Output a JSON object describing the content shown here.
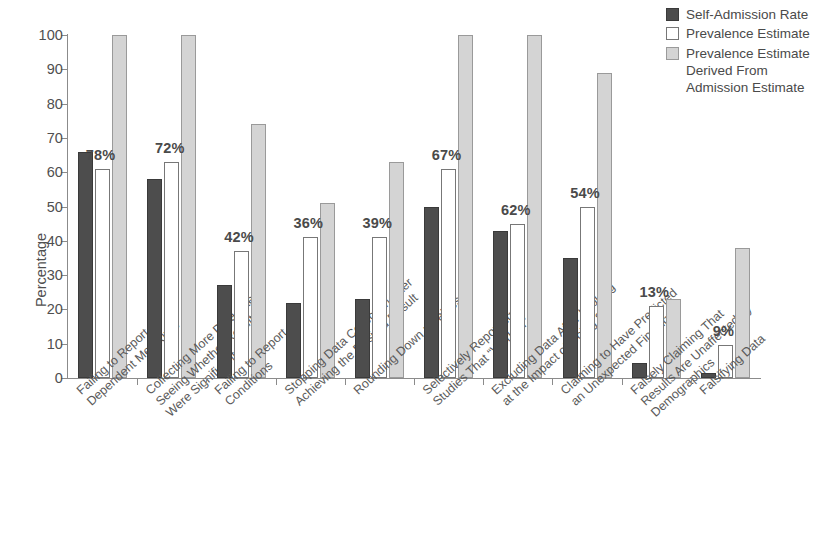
{
  "chart_data": {
    "type": "bar",
    "title": "",
    "xlabel": "",
    "ylabel": "Percentage",
    "ylim": [
      0,
      100
    ],
    "ytick_labels": [
      "100",
      "90",
      "80",
      "70",
      "60",
      "50",
      "40",
      "30",
      "20",
      "10",
      "0"
    ],
    "yticks": [
      100,
      90,
      80,
      70,
      60,
      50,
      40,
      30,
      20,
      10,
      0
    ],
    "grid": false,
    "legend_position": "top-right",
    "categories": [
      "Failing to Report All Dependent Measures",
      "Collecting More Data After Seeing Whether Results Were Significant",
      "Failing to Report All Conditions",
      "Stopping Data Collection After Achieving the Desired Result",
      "Rounding Down p Values",
      "Selectively Reporting Studies That “Worked”",
      "Excluding Data After Looking at the Impact of Doing So",
      "Claiming to Have Predicted an Unexpected Finding",
      "Falsely Claiming That Results Are Unaffected by Demographics",
      "Falsifying Data"
    ],
    "category_lines": [
      [
        "Failing to Report All",
        "Dependent Measures"
      ],
      [
        "Collecting More Data After",
        "Seeing Whether Results",
        "Were Significant"
      ],
      [
        "Failing to Report All",
        "Conditions"
      ],
      [
        "Stopping Data Collection After",
        "Achieving the Desired Result"
      ],
      [
        "Rounding Down p Values"
      ],
      [
        "Selectively Reporting",
        "Studies That “Worked”"
      ],
      [
        "Excluding Data After Looking",
        "at the Impact of Doing So"
      ],
      [
        "Claiming to Have Predicted",
        "an Unexpected Finding"
      ],
      [
        "Falsely Claiming That",
        "Results Are Unaffected by",
        "Demographics"
      ],
      [
        "Falsifying Data"
      ]
    ],
    "series": [
      {
        "name": "Self-Admission Rate",
        "color": "#4d4d4d",
        "values": [
          66,
          58,
          27,
          22,
          23,
          50,
          43,
          35,
          4.5,
          1.5
        ]
      },
      {
        "name": "Prevalence Estimate",
        "color": "#ffffff",
        "values": [
          61,
          63,
          37,
          41,
          41,
          61,
          45,
          50,
          21,
          9.5
        ]
      },
      {
        "name": "Prevalence Estimate Derived From Admission Estimate",
        "color": "#d4d4d4",
        "values": [
          100,
          100,
          74,
          51,
          63,
          100,
          100,
          89,
          23,
          38
        ]
      }
    ],
    "bar_labels": [
      "78%",
      "72%",
      "42%",
      "36%",
      "39%",
      "67%",
      "62%",
      "54%",
      "13%",
      "9%"
    ]
  },
  "legend": {
    "entries": [
      {
        "label_lines": [
          "Self-Admission Rate"
        ],
        "swatch": "dark-gray-swatch"
      },
      {
        "label_lines": [
          "Prevalence Estimate"
        ],
        "swatch": "white-swatch"
      },
      {
        "label_lines": [
          "Prevalence Estimate",
          "Derived From",
          "Admission Estimate"
        ],
        "swatch": "light-gray-swatch"
      }
    ]
  }
}
